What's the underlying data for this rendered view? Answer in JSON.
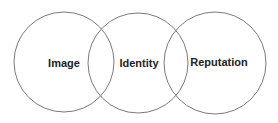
{
  "diagram": {
    "type": "venn",
    "stroke_color": "#7a7a7a",
    "text_color": "#222222",
    "circles": [
      {
        "label": "Image",
        "cx": 64,
        "cy": 62,
        "r": 50,
        "label_x": 64,
        "label_y": 63
      },
      {
        "label": "Identity",
        "cx": 138,
        "cy": 63,
        "r": 50,
        "label_x": 139,
        "label_y": 63
      },
      {
        "label": "Reputation",
        "cx": 215,
        "cy": 63,
        "r": 51,
        "label_x": 219,
        "label_y": 62
      }
    ]
  }
}
